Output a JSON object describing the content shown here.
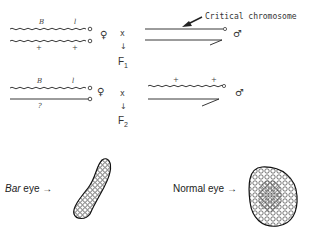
{
  "annotation": {
    "critical_label": "Critical chromosome"
  },
  "parental_cross": {
    "female": {
      "sex_symbol": "♀",
      "chromosome_top": {
        "labels": [
          "B",
          "l"
        ]
      },
      "chromosome_bottom": {
        "labels": [
          "+",
          "+"
        ]
      }
    },
    "cross_symbol": "x",
    "arrow": "↓",
    "generation": {
      "letter": "F",
      "index": "1"
    },
    "male": {
      "sex_symbol": "♂"
    }
  },
  "f1_cross": {
    "female": {
      "sex_symbol": "♀",
      "chromosome_top": {
        "labels": [
          "B",
          "l"
        ]
      },
      "chromosome_bottom": {
        "labels": [
          "?"
        ]
      }
    },
    "cross_symbol": "x",
    "arrow": "↓",
    "generation": {
      "letter": "F",
      "index": "2"
    },
    "male": {
      "sex_symbol": "♂",
      "chromosome_top": {
        "labels": [
          "+",
          "+"
        ]
      }
    }
  },
  "eyes": {
    "bar": {
      "label_italic": "Bar",
      "label_rest": " eye →"
    },
    "normal": {
      "label": "Normal eye →"
    }
  }
}
